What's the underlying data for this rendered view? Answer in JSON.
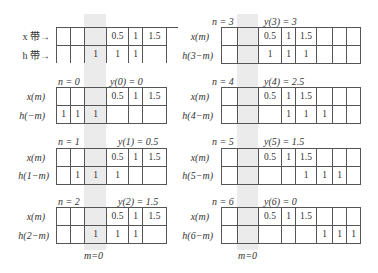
{
  "intro": {
    "x_strip_label": "x 带→",
    "h_strip_label": "h 带→",
    "x_row": [
      "",
      "",
      "",
      "0.5",
      "1",
      "1.5"
    ],
    "h_row": [
      "",
      "",
      "1",
      "1",
      "1",
      ""
    ]
  },
  "left_panels": [
    {
      "n_label": "n = 0",
      "y_label": "y(0) = 0",
      "x_label": "x(m)",
      "h_label": "h(−m)",
      "x_row": [
        "",
        "",
        "",
        "0.5",
        "1",
        "1.5"
      ],
      "h_row": [
        "1",
        "1",
        "1",
        "",
        "",
        ""
      ]
    },
    {
      "n_label": "n = 1",
      "y_label": "y(1) = 0.5",
      "x_label": "x(m)",
      "h_label": "h(1−m)",
      "x_row": [
        "",
        "",
        "",
        "0.5",
        "1",
        "1.5"
      ],
      "h_row": [
        "",
        "1",
        "1",
        "1",
        "",
        ""
      ]
    },
    {
      "n_label": "n = 2",
      "y_label": "y(2) = 1.5",
      "x_label": "x(m)",
      "h_label": "h(2−m)",
      "x_row": [
        "",
        "",
        "",
        "0.5",
        "1",
        "1.5"
      ],
      "h_row": [
        "",
        "",
        "1",
        "1",
        "1",
        ""
      ]
    }
  ],
  "right_panels": [
    {
      "n_label": "n = 3",
      "y_label": "y(3) = 3",
      "x_label": "x(m)",
      "h_label": "h(3−m)",
      "x_row": [
        "",
        "",
        "0.5",
        "1",
        "1.5",
        "",
        "",
        ""
      ],
      "h_row": [
        "",
        "",
        "1",
        "1",
        "1",
        "",
        "",
        ""
      ]
    },
    {
      "n_label": "n = 4",
      "y_label": "y(4) = 2.5",
      "x_label": "x(m)",
      "h_label": "h(4−m)",
      "x_row": [
        "",
        "",
        "0.5",
        "1",
        "1.5",
        "",
        "",
        ""
      ],
      "h_row": [
        "",
        "",
        "",
        "1",
        "1",
        "1",
        "",
        ""
      ]
    },
    {
      "n_label": "n = 5",
      "y_label": "y(5) = 1.5",
      "x_label": "x(m)",
      "h_label": "h(5−m)",
      "x_row": [
        "",
        "",
        "0.5",
        "1",
        "1.5",
        "",
        "",
        ""
      ],
      "h_row": [
        "",
        "",
        "",
        "",
        "1",
        "1",
        "1",
        ""
      ]
    },
    {
      "n_label": "n = 6",
      "y_label": "y(6) = 0",
      "x_label": "x(m)",
      "h_label": "h(6−m)",
      "x_row": [
        "",
        "",
        "0.5",
        "1",
        "1.5",
        "",
        "",
        ""
      ],
      "h_row": [
        "",
        "",
        "",
        "",
        "",
        "1",
        "1",
        "1"
      ]
    }
  ],
  "footer": {
    "left_m0": "m=0",
    "right_m0": "m=0"
  }
}
